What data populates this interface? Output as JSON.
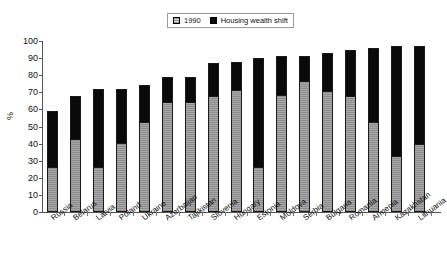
{
  "chart_data": {
    "type": "bar",
    "subtype": "stacked-bar",
    "title": "",
    "xlabel": "",
    "ylabel": "%",
    "ylim": [
      0,
      100
    ],
    "yticks": [
      0,
      10,
      20,
      30,
      40,
      50,
      60,
      70,
      80,
      90,
      100
    ],
    "grid": false,
    "legend_position": "top-center",
    "legend": [
      "1990",
      "Housing wealth shift"
    ],
    "categories": [
      "Russia",
      "Belarus",
      "Latvia",
      "Poland",
      "Ukraine",
      "Azerbaijan",
      "Tajikistan",
      "Slovenia",
      "Hungary",
      "Estonia",
      "Moldova",
      "Serbia",
      "Bulgaria",
      "Romania",
      "Armenia",
      "Kazakhstan",
      "Lithuania"
    ],
    "series": [
      {
        "name": "1990",
        "color": "#9a9a9a",
        "values": [
          26,
          42,
          26,
          40,
          52,
          64,
          64,
          67,
          71,
          26,
          68,
          76,
          70,
          67,
          52,
          32,
          39
        ]
      },
      {
        "name": "Housing wealth shift",
        "color": "#0a0a0a",
        "values": [
          33,
          26,
          46,
          32,
          22,
          15,
          15,
          20,
          17,
          64,
          23,
          15,
          23,
          28,
          44,
          65,
          58
        ]
      }
    ],
    "totals": [
      59,
      68,
      72,
      72,
      74,
      79,
      79,
      87,
      88,
      90,
      91,
      91,
      93,
      95,
      96,
      97,
      97
    ]
  },
  "legend": {
    "items": [
      {
        "label": "1990",
        "swatch": "gray"
      },
      {
        "label": "Housing wealth shift",
        "swatch": "black"
      }
    ]
  },
  "axis": {
    "y_label": "%",
    "y_ticks": [
      "0",
      "10",
      "20",
      "30",
      "40",
      "50",
      "60",
      "70",
      "80",
      "90",
      "100"
    ]
  }
}
